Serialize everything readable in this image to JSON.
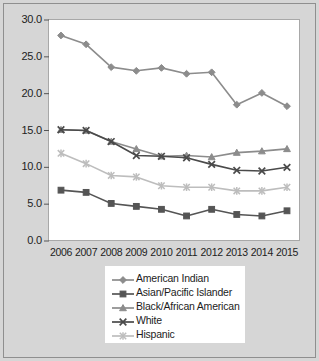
{
  "chart_data": {
    "type": "line",
    "title": "",
    "subtitle": "",
    "xlabel": "",
    "ylabel": "",
    "categories": [
      "2006",
      "2007",
      "2008",
      "2009",
      "2010",
      "2011",
      "2012",
      "2013",
      "2014",
      "2015"
    ],
    "x": [
      2006,
      2007,
      2008,
      2009,
      2010,
      2011,
      2012,
      2013,
      2014,
      2015
    ],
    "ylim": [
      0.0,
      30.0
    ],
    "ytick_labels": [
      "0.0",
      "5.0",
      "10.0",
      "15.0",
      "20.0",
      "25.0",
      "30.0"
    ],
    "ytick_values": [
      0.0,
      5.0,
      10.0,
      15.0,
      20.0,
      25.0,
      30.0
    ],
    "grid": false,
    "legend_position": "bottom-center",
    "series": [
      {
        "name": "American Indian",
        "marker": "diamond",
        "color": "#8c8c8c",
        "values": [
          27.9,
          26.7,
          23.6,
          23.1,
          23.5,
          22.7,
          22.9,
          18.5,
          20.1,
          18.3
        ]
      },
      {
        "name": "Asian/Pacific Islander",
        "marker": "square",
        "color": "#555555",
        "values": [
          6.9,
          6.6,
          5.1,
          4.7,
          4.3,
          3.4,
          4.3,
          3.6,
          3.4,
          4.1
        ]
      },
      {
        "name": "Black/African American",
        "marker": "triangle",
        "color": "#8c8c8c",
        "values": [
          15.1,
          15.0,
          13.5,
          12.5,
          11.5,
          11.6,
          11.4,
          12.0,
          12.2,
          12.5
        ]
      },
      {
        "name": "White",
        "marker": "x",
        "color": "#4a4a4a",
        "values": [
          15.1,
          15.0,
          13.5,
          11.6,
          11.5,
          11.3,
          10.4,
          9.6,
          9.5,
          10.0
        ]
      },
      {
        "name": "Hispanic",
        "marker": "asterisk",
        "color": "#bdbdbd",
        "values": [
          11.9,
          10.5,
          8.9,
          8.7,
          7.5,
          7.3,
          7.3,
          6.8,
          6.8,
          7.3
        ]
      }
    ]
  },
  "legend": {
    "items": [
      {
        "label": "American Indian"
      },
      {
        "label": "Asian/Pacific Islander"
      },
      {
        "label": "Black/African American"
      },
      {
        "label": "White"
      },
      {
        "label": "Hispanic"
      }
    ]
  }
}
